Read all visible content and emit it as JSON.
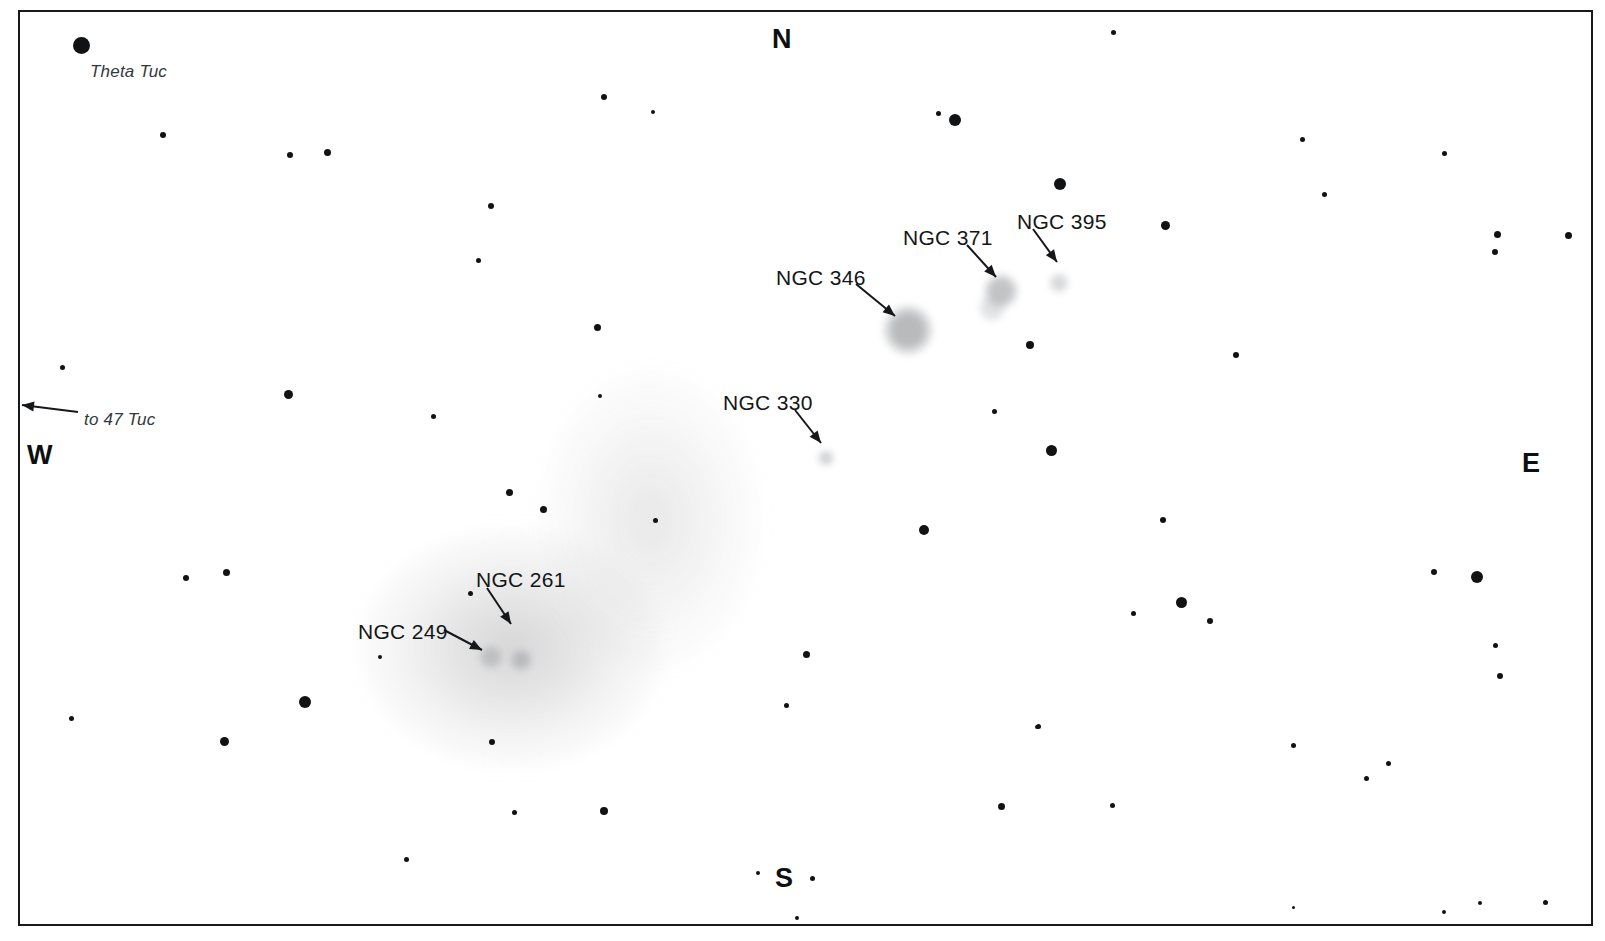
{
  "chart": {
    "title_partial": "g                       g",
    "background_color": "#ffffff",
    "ink_color": "#16181a",
    "frame": {
      "x": 18,
      "y": 10,
      "width": 1575,
      "height": 916,
      "border_px": 2
    }
  },
  "cardinals": [
    {
      "name": "north",
      "label": "N",
      "x": 772,
      "y": 24
    },
    {
      "name": "south",
      "label": "S",
      "x": 775,
      "y": 863
    },
    {
      "name": "east",
      "label": "E",
      "x": 1522,
      "y": 448
    },
    {
      "name": "west",
      "label": "W",
      "x": 27,
      "y": 440
    }
  ],
  "object_labels": [
    {
      "name": "theta-tuc",
      "text": "Theta Tuc",
      "style": "italic",
      "x": 90,
      "y": 62
    },
    {
      "name": "to-47-tuc",
      "text": "to 47 Tuc",
      "style": "italic",
      "x": 84,
      "y": 410
    },
    {
      "name": "ngc-346",
      "text": "NGC 346",
      "style": "roman",
      "x": 776,
      "y": 266
    },
    {
      "name": "ngc-371",
      "text": "NGC 371",
      "style": "roman",
      "x": 903,
      "y": 226
    },
    {
      "name": "ngc-395",
      "text": "NGC 395",
      "style": "roman",
      "x": 1017,
      "y": 210
    },
    {
      "name": "ngc-330",
      "text": "NGC 330",
      "style": "roman",
      "x": 723,
      "y": 391
    },
    {
      "name": "ngc-261",
      "text": "NGC 261",
      "style": "roman",
      "x": 476,
      "y": 568
    },
    {
      "name": "ngc-249",
      "text": "NGC 249",
      "style": "roman",
      "x": 358,
      "y": 620
    }
  ],
  "arrows": [
    {
      "name": "arrow-to-47-tuc",
      "x1": 78,
      "y1": 412,
      "x2": 22,
      "y2": 405
    },
    {
      "name": "arrow-ngc-346",
      "x1": 856,
      "y1": 284,
      "x2": 895,
      "y2": 316
    },
    {
      "name": "arrow-ngc-371",
      "x1": 967,
      "y1": 245,
      "x2": 996,
      "y2": 277
    },
    {
      "name": "arrow-ngc-395",
      "x1": 1033,
      "y1": 229,
      "x2": 1057,
      "y2": 262
    },
    {
      "name": "arrow-ngc-330",
      "x1": 795,
      "y1": 410,
      "x2": 821,
      "y2": 443
    },
    {
      "name": "arrow-ngc-261",
      "x1": 487,
      "y1": 588,
      "x2": 511,
      "y2": 624
    },
    {
      "name": "arrow-ngc-249",
      "x1": 444,
      "y1": 630,
      "x2": 482,
      "y2": 650
    }
  ],
  "nebulae": [
    {
      "name": "smc-main-body",
      "x": 512,
      "y": 648,
      "rx": 150,
      "ry": 118,
      "opacity": 1.0
    },
    {
      "name": "smc-wing-extension",
      "x": 650,
      "y": 520,
      "rx": 110,
      "ry": 150,
      "opacity": 0.55
    },
    {
      "name": "ngc-346-blob",
      "x": 908,
      "y": 330,
      "r": 27,
      "tone": "#8e9094",
      "opacity": 0.62
    },
    {
      "name": "ngc-371-blob",
      "x": 1001,
      "y": 291,
      "r": 19,
      "tone": "#97999d",
      "opacity": 0.58
    },
    {
      "name": "ngc-371-halo",
      "x": 992,
      "y": 308,
      "r": 15,
      "tone": "#b4b6ba",
      "opacity": 0.4
    },
    {
      "name": "ngc-395-blob",
      "x": 1059,
      "y": 283,
      "r": 11,
      "tone": "#a9abaf",
      "opacity": 0.45
    },
    {
      "name": "ngc-330-blob",
      "x": 826,
      "y": 458,
      "r": 9,
      "tone": "#a3a5a9",
      "opacity": 0.5
    },
    {
      "name": "ngc-249-blob",
      "x": 491,
      "y": 657,
      "r": 13,
      "tone": "#9a9ca0",
      "opacity": 0.45
    },
    {
      "name": "ngc-261-blob",
      "x": 521,
      "y": 660,
      "r": 12,
      "tone": "#96989c",
      "opacity": 0.48
    }
  ],
  "stars": [
    {
      "name": "theta-tuc-star",
      "x": 81,
      "y": 45,
      "d": 17
    },
    {
      "x": 163,
      "y": 135,
      "d": 6
    },
    {
      "x": 290,
      "y": 155,
      "d": 6
    },
    {
      "x": 327,
      "y": 152,
      "d": 7
    },
    {
      "x": 604,
      "y": 97,
      "d": 6
    },
    {
      "x": 653,
      "y": 112,
      "d": 4
    },
    {
      "x": 938,
      "y": 113,
      "d": 5
    },
    {
      "x": 955,
      "y": 120,
      "d": 12
    },
    {
      "x": 1113,
      "y": 32,
      "d": 5
    },
    {
      "x": 1060,
      "y": 184,
      "d": 12
    },
    {
      "x": 1165,
      "y": 225,
      "d": 9
    },
    {
      "x": 1302,
      "y": 139,
      "d": 5
    },
    {
      "x": 1444,
      "y": 153,
      "d": 5
    },
    {
      "x": 1324,
      "y": 194,
      "d": 5
    },
    {
      "x": 1497,
      "y": 234,
      "d": 7
    },
    {
      "x": 1495,
      "y": 252,
      "d": 6
    },
    {
      "x": 1568,
      "y": 235,
      "d": 7
    },
    {
      "x": 491,
      "y": 206,
      "d": 6
    },
    {
      "x": 478,
      "y": 260,
      "d": 5
    },
    {
      "x": 597,
      "y": 327,
      "d": 7
    },
    {
      "x": 600,
      "y": 396,
      "d": 4
    },
    {
      "x": 433,
      "y": 416,
      "d": 5
    },
    {
      "x": 288,
      "y": 394,
      "d": 9
    },
    {
      "x": 62,
      "y": 367,
      "d": 5
    },
    {
      "x": 1030,
      "y": 345,
      "d": 8
    },
    {
      "x": 1236,
      "y": 355,
      "d": 6
    },
    {
      "x": 994,
      "y": 411,
      "d": 5
    },
    {
      "x": 1051,
      "y": 450,
      "d": 11
    },
    {
      "x": 509,
      "y": 492,
      "d": 7
    },
    {
      "x": 655,
      "y": 520,
      "d": 5
    },
    {
      "x": 924,
      "y": 530,
      "d": 10
    },
    {
      "x": 1163,
      "y": 520,
      "d": 6
    },
    {
      "x": 1181,
      "y": 602,
      "d": 11
    },
    {
      "x": 1210,
      "y": 621,
      "d": 6
    },
    {
      "x": 1434,
      "y": 572,
      "d": 6
    },
    {
      "x": 1477,
      "y": 577,
      "d": 12
    },
    {
      "x": 1500,
      "y": 676,
      "d": 6
    },
    {
      "x": 1495,
      "y": 645,
      "d": 5
    },
    {
      "x": 1133,
      "y": 613,
      "d": 5
    },
    {
      "x": 1038,
      "y": 726,
      "d": 5
    },
    {
      "x": 1037,
      "y": 727,
      "d": 4
    },
    {
      "x": 1293,
      "y": 745,
      "d": 5
    },
    {
      "x": 1366,
      "y": 778,
      "d": 5
    },
    {
      "x": 1001,
      "y": 806,
      "d": 7
    },
    {
      "x": 1112,
      "y": 805,
      "d": 5
    },
    {
      "x": 1388,
      "y": 763,
      "d": 5
    },
    {
      "x": 1545,
      "y": 902,
      "d": 5
    },
    {
      "x": 1480,
      "y": 903,
      "d": 4
    },
    {
      "x": 1444,
      "y": 912,
      "d": 4
    },
    {
      "x": 186,
      "y": 578,
      "d": 6
    },
    {
      "x": 226,
      "y": 572,
      "d": 7
    },
    {
      "x": 71,
      "y": 718,
      "d": 5
    },
    {
      "x": 305,
      "y": 702,
      "d": 12
    },
    {
      "x": 224,
      "y": 741,
      "d": 9
    },
    {
      "x": 380,
      "y": 657,
      "d": 4
    },
    {
      "x": 543,
      "y": 509,
      "d": 7
    },
    {
      "x": 470,
      "y": 593,
      "d": 5
    },
    {
      "x": 492,
      "y": 742,
      "d": 6
    },
    {
      "x": 514,
      "y": 812,
      "d": 5
    },
    {
      "x": 604,
      "y": 811,
      "d": 8
    },
    {
      "x": 406,
      "y": 859,
      "d": 5
    },
    {
      "x": 758,
      "y": 873,
      "d": 4
    },
    {
      "x": 812,
      "y": 878,
      "d": 5
    },
    {
      "x": 797,
      "y": 918,
      "d": 4
    },
    {
      "x": 806,
      "y": 654,
      "d": 7
    },
    {
      "x": 786,
      "y": 705,
      "d": 5
    },
    {
      "x": 1293,
      "y": 907,
      "d": 3
    }
  ]
}
